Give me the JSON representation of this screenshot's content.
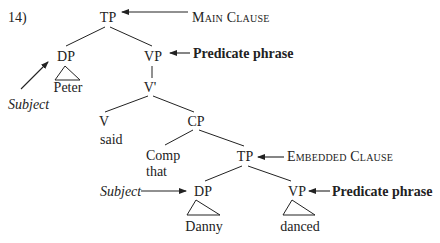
{
  "example_number": "14)",
  "tree": {
    "root": {
      "label": "TP",
      "annotation": "Main Clause"
    },
    "subject_dp": {
      "label": "DP",
      "leaf": "Peter",
      "annotation": "Subject"
    },
    "main_vp": {
      "label": "VP",
      "annotation": "Predicate phrase"
    },
    "v_bar": {
      "label": "V'"
    },
    "verb": {
      "label": "V",
      "leaf": "said"
    },
    "cp": {
      "label": "CP"
    },
    "comp": {
      "label": "Comp",
      "leaf": "that"
    },
    "embedded_tp": {
      "label": "TP",
      "annotation": "Embedded Clause"
    },
    "embedded_dp": {
      "label": "DP",
      "leaf": "Danny",
      "annotation": "Subject"
    },
    "embedded_vp": {
      "label": "VP",
      "leaf": "danced",
      "annotation": "Predicate phrase"
    }
  },
  "colors": {
    "ink": "#222222",
    "background": "#ffffff"
  }
}
